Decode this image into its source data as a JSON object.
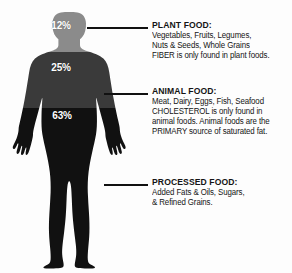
{
  "figure": {
    "alt_name": "human-body-silhouette",
    "segments": [
      {
        "id": "head",
        "label": "12%",
        "color": "#8b8b8b",
        "region": "head-and-neck"
      },
      {
        "id": "torso",
        "label": "25%",
        "color": "#3a3a3a",
        "region": "upper-torso-and-arms"
      },
      {
        "id": "lower",
        "label": "63%",
        "color": "#111111",
        "region": "lower-body-and-legs"
      }
    ],
    "label_color": "#ffffff",
    "background_color": "#fdfdfd",
    "leader_line_color": "#111111"
  },
  "blocks": {
    "plant": {
      "heading": "PLANT FOOD:",
      "lines": [
        "Vegetables, Fruits, Legumes,",
        "Nuts & Seeds, Whole Grains",
        "FIBER is only found in plant foods."
      ],
      "emphasis": "FIBER"
    },
    "animal": {
      "heading": "ANIMAL FOOD:",
      "lines": [
        "Meat, Dairy, Eggs, Fish, Seafood",
        "CHOLESTEROL is only found in",
        "animal foods. Animal foods are the",
        "PRIMARY source of saturated fat."
      ],
      "emphasis": [
        "CHOLESTEROL",
        "PRIMARY"
      ]
    },
    "processed": {
      "heading": "PROCESSED FOOD:",
      "lines": [
        "Added Fats & Oils, Sugars,",
        "& Refined Grains."
      ]
    }
  }
}
